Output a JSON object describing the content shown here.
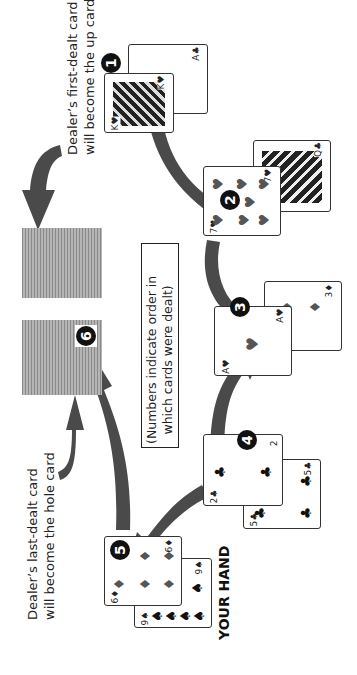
{
  "labels": {
    "dealer_first": [
      "Dealer’s first-dealt card",
      "will become the up card"
    ],
    "dealer_last": [
      "Dealer’s last-dealt card",
      "will become the hole card"
    ],
    "note": [
      "(Numbers indicate order in",
      "which cards were dealt)"
    ],
    "your_hand": "YOUR HAND"
  },
  "deal_steps": [
    {
      "order": "1",
      "recipient": "dealer",
      "card": "K♥",
      "rank": "K",
      "suit": "♥",
      "paired_with": "A♣"
    },
    {
      "order": "2",
      "recipient": "player",
      "card": "7♥",
      "rank": "7",
      "suit": "♥",
      "paired_with": "Q♣"
    },
    {
      "order": "3",
      "recipient": "player",
      "card": "A♥",
      "rank": "A",
      "suit": "♥",
      "paired_with": "3♦"
    },
    {
      "order": "4",
      "recipient": "player",
      "card": "2♣",
      "rank": "2",
      "suit": "♣",
      "paired_with": "5♣"
    },
    {
      "order": "5",
      "recipient": "player",
      "card": "6♦",
      "rank": "6",
      "suit": "♦",
      "paired_with": "9♠"
    },
    {
      "order": "6",
      "recipient": "dealer",
      "card": "face-down",
      "rank": "",
      "suit": ""
    }
  ],
  "cards": {
    "c1_back": {
      "rank": "A",
      "suit": "♣"
    },
    "c1_front": {
      "rank": "K",
      "suit": "♥"
    },
    "c2_back": {
      "rank": "Q",
      "suit": "♣"
    },
    "c2_front": {
      "rank": "7",
      "suit": "♥"
    },
    "c3_back": {
      "rank": "3",
      "suit": "♦"
    },
    "c3_front": {
      "rank": "A",
      "suit": "♥"
    },
    "c4_back": {
      "rank": "5",
      "suit": "♣"
    },
    "c4_front": {
      "rank": "2",
      "suit": "♣"
    },
    "c5_back": {
      "rank": "9",
      "suit": "♠"
    },
    "c5_front": {
      "rank": "6",
      "suit": "♦"
    }
  },
  "colors": {
    "arrow": "#4a4a4a",
    "badge": "#111111",
    "card_back": "#9a9a9a"
  }
}
